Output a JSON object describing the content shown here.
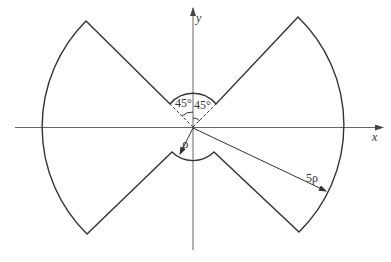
{
  "diagram": {
    "type": "annular sector figure (bow-tie shape) with coordinate axes",
    "axes": {
      "x_label": "x",
      "y_label": "y"
    },
    "annotations": {
      "angle_left": "45°",
      "angle_right": "45°",
      "inner_radius": "ρ",
      "outer_radius": "5ρ"
    },
    "colors": {
      "shape_stroke": "#333333",
      "axis_stroke": "#555555",
      "background": "#ffffff"
    }
  }
}
